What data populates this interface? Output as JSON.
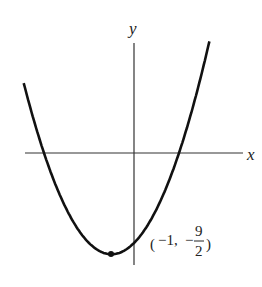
{
  "chart_data": {
    "type": "line",
    "title": "",
    "function": "y = (1/2)x^2 + x - 4",
    "xlabel": "x",
    "ylabel": "y",
    "grid": false,
    "legend": null,
    "vertex": {
      "x": -1,
      "y": -4.5
    },
    "annotations": [
      {
        "text": "(−1, −9/2)",
        "x": -1,
        "y": -4.5
      }
    ],
    "x_intercepts": [
      -4,
      2
    ],
    "y_intercept": -4,
    "xlim": [
      -4.9,
      4.7
    ],
    "ylim": [
      -5,
      5.2
    ]
  },
  "labels": {
    "x_axis": "x",
    "y_axis": "y",
    "vertex_open": "(",
    "vertex_x": "−1,",
    "vertex_minus": "−",
    "vertex_num": "9",
    "vertex_den": "2",
    "vertex_close": ")"
  }
}
